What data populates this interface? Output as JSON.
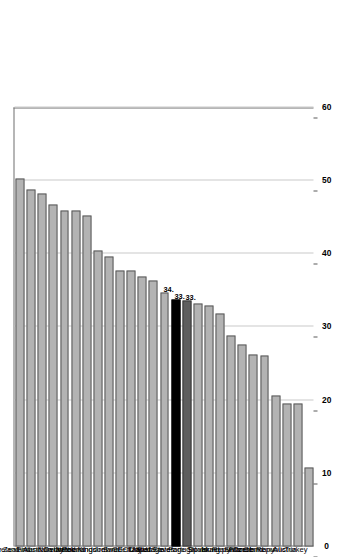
{
  "chart_data": {
    "type": "bar",
    "title": "",
    "subtitle": "",
    "xlabel": "",
    "ylabel": "",
    "orientation": "vertical-rotated",
    "grid": true,
    "legend": "none",
    "ylim": [
      0,
      60
    ],
    "yticks": [
      0,
      10,
      20,
      30,
      40,
      50,
      60
    ],
    "ytick_labels": [
      "0",
      "10",
      "20",
      "30",
      "40",
      "50",
      "60"
    ],
    "categories": [
      "Iceland",
      "New Zealand",
      "Finland",
      "Australia",
      "Norway",
      "Denmark",
      "Poland",
      "Netherlands",
      "United Kingdom",
      "Ireland",
      "Sweden",
      "Italy",
      "Japan",
      "OECD average",
      "United States",
      "EU19 average",
      "Portugal",
      "Spain",
      "Israel",
      "Hungary",
      "Slovak Republic",
      "France",
      "Switzerland",
      "Germany",
      "Czech Republic",
      "Austria",
      "Turkey"
    ],
    "values": [
      50.3,
      48.8,
      48.2,
      46.8,
      45.9,
      45.9,
      45.3,
      40.5,
      39.6,
      37.7,
      37.7,
      36.9,
      36.3,
      34.7,
      33.8,
      33.6,
      33.2,
      33.0,
      31.8,
      28.8,
      27.6,
      26.3,
      26.1,
      20.6,
      19.6,
      19.5,
      10.8
    ],
    "highlight": {
      "OECD average": "gray-dark",
      "United States": "black",
      "EU19 average": "dark-gray"
    },
    "data_labels": [
      {
        "category": "OECD average",
        "text": "34."
      },
      {
        "category": "United States",
        "text": "33."
      },
      {
        "category": "EU19 average",
        "text": "33."
      }
    ],
    "colors": {
      "bar": "#b3b3b3",
      "bar_edge": "#5a5a5a",
      "united_states": "#000000",
      "eu19_average": "#5e5e5e",
      "grid": "#c9c9c9",
      "axis": "#6e6e6e",
      "background": "#ffffff"
    }
  }
}
